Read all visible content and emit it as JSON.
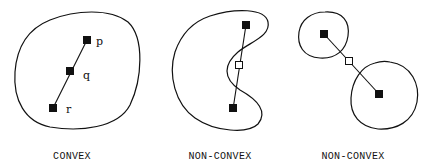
{
  "figure": {
    "panels": [
      {
        "caption": "CONVEX",
        "points": [
          {
            "label": "p",
            "type": "in-set"
          },
          {
            "label": "q",
            "type": "in-set"
          },
          {
            "label": "r",
            "type": "in-set"
          }
        ]
      },
      {
        "caption": "NON-CONVEX",
        "points": [
          {
            "label": "",
            "type": "in-set"
          },
          {
            "label": "",
            "type": "outside-set"
          },
          {
            "label": "",
            "type": "in-set"
          }
        ]
      },
      {
        "caption": "NON-CONVEX",
        "points": [
          {
            "label": "",
            "type": "in-set"
          },
          {
            "label": "",
            "type": "outside-set"
          },
          {
            "label": "",
            "type": "in-set"
          }
        ]
      }
    ],
    "colors": {
      "ink": "#111111",
      "background": "#ffffff"
    }
  }
}
